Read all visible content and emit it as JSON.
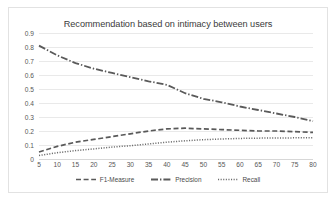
{
  "chart_data": {
    "type": "line",
    "title": "Recommendation based on intimacy between users",
    "xlabel": "",
    "ylabel": "",
    "x": [
      5,
      10,
      15,
      20,
      25,
      30,
      35,
      40,
      45,
      50,
      55,
      60,
      65,
      70,
      75,
      80
    ],
    "xlim": [
      5,
      80
    ],
    "ylim": [
      0,
      0.9
    ],
    "y_ticks": [
      "0",
      "0.1",
      "0.2",
      "0.3",
      "0.4",
      "0.5",
      "0.6",
      "0.7",
      "0.8",
      "0.9"
    ],
    "x_ticks": [
      "5",
      "10",
      "15",
      "20",
      "25",
      "30",
      "35",
      "40",
      "45",
      "50",
      "55",
      "60",
      "65",
      "70",
      "75",
      "80"
    ],
    "grid": true,
    "legend_position": "bottom",
    "series": [
      {
        "name": "F1-Measure",
        "style": "dashed",
        "color": "#595959",
        "values": [
          0.05,
          0.09,
          0.12,
          0.14,
          0.16,
          0.18,
          0.2,
          0.215,
          0.22,
          0.215,
          0.21,
          0.205,
          0.2,
          0.2,
          0.195,
          0.19
        ]
      },
      {
        "name": "Precision",
        "style": "dash-dot",
        "color": "#5a5a5a",
        "values": [
          0.81,
          0.74,
          0.685,
          0.645,
          0.615,
          0.585,
          0.555,
          0.53,
          0.47,
          0.43,
          0.405,
          0.375,
          0.35,
          0.325,
          0.3,
          0.27
        ]
      },
      {
        "name": "Recall",
        "style": "dotted",
        "color": "#6b6b6b",
        "values": [
          0.025,
          0.045,
          0.06,
          0.072,
          0.085,
          0.095,
          0.108,
          0.12,
          0.13,
          0.138,
          0.143,
          0.147,
          0.149,
          0.15,
          0.151,
          0.152
        ]
      }
    ]
  },
  "legend": {
    "items": [
      {
        "label": "F1-Measure",
        "style": "dashed"
      },
      {
        "label": "Precision",
        "style": "dash-dot"
      },
      {
        "label": "Recall",
        "style": "dotted"
      }
    ]
  }
}
